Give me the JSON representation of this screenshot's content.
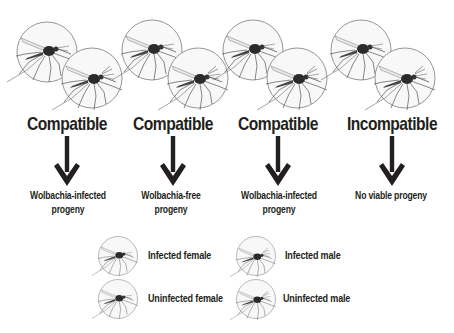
{
  "crosses": [
    {
      "female": "infected",
      "male": "infected",
      "result": "Compatible",
      "offspring": "Wolbachia-infected progeny",
      "offspring_lines": [
        "Wolbachia-infected",
        "progeny"
      ]
    },
    {
      "female": "uninfected",
      "male": "uninfected",
      "result": "Compatible",
      "offspring": "Wolbachia-free progeny",
      "offspring_lines": [
        "Wolbachia-free",
        "progeny"
      ]
    },
    {
      "female": "infected",
      "male": "uninfected",
      "result": "Compatible",
      "offspring": "Wolbachia-infected progeny",
      "offspring_lines": [
        "Wolbachia-infected",
        "progeny"
      ]
    },
    {
      "female": "uninfected",
      "male": "infected",
      "result": "Incompatible",
      "offspring": "No viable progeny",
      "offspring_lines": [
        "No viable progeny"
      ]
    }
  ],
  "legend": {
    "infected_female": "Infected female",
    "infected_male": "Infected male",
    "uninfected_female": "Uninfected female",
    "uninfected_male": "Uninfected male"
  },
  "icons": {
    "mosquito": "mosquito-in-circle-icon",
    "arrow": "arrow-down-icon"
  },
  "colors": {
    "text": "#231f20",
    "circle_stroke": "#8a8a8a",
    "circle_fill": "#f7f7f7",
    "arrow": "#231f20"
  }
}
